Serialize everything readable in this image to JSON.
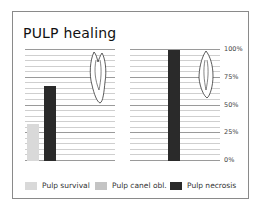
{
  "title": "PULP healing",
  "chart_data": {
    "type": "bar",
    "title": "PULP healing",
    "xlabel": "",
    "ylabel": "",
    "ylim": [
      0,
      100
    ],
    "yticks": [
      "0%",
      "25%",
      "50%",
      "75%",
      "100%"
    ],
    "grid": true,
    "legend_position": "bottom",
    "panels": [
      {
        "name": "left",
        "series": [
          {
            "name": "Pulp survival",
            "value": 33
          },
          {
            "name": "Pulp canel obl.",
            "value": 0
          },
          {
            "name": "Pulp necrosis",
            "value": 68
          }
        ]
      },
      {
        "name": "right",
        "series": [
          {
            "name": "Pulp survival",
            "value": 0
          },
          {
            "name": "Pulp canel obl.",
            "value": 0
          },
          {
            "name": "Pulp necrosis",
            "value": 100
          }
        ]
      }
    ],
    "legend": [
      "Pulp survival",
      "Pulp canel obl.",
      "Pulp necrosis"
    ],
    "colors": {
      "Pulp survival": "#d9d9d9",
      "Pulp canel obl.": "#c4c4c4",
      "Pulp necrosis": "#2a2a2a"
    }
  },
  "legend": {
    "items": [
      {
        "label": "Pulp survival",
        "color": "#d9d9d9"
      },
      {
        "label": "Pulp canel obl.",
        "color": "#c4c4c4"
      },
      {
        "label": "Pulp necrosis",
        "color": "#2a2a2a"
      }
    ]
  },
  "ticks": [
    "100%",
    "75%",
    "50%",
    "25%",
    "0%"
  ]
}
